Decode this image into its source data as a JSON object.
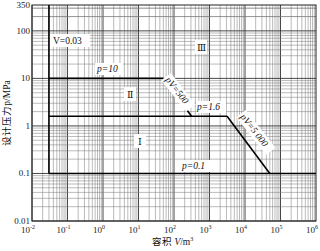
{
  "chart_data": {
    "type": "line",
    "title": "",
    "xlabel": "容积 V/m³",
    "ylabel": "设计压力p/MPa",
    "x_scale": "log",
    "y_scale": "log",
    "xlim": [
      0.01,
      1000000
    ],
    "ylim": [
      0.01,
      350
    ],
    "grid": true,
    "x_ticks": [
      "10⁻²",
      "10⁻¹",
      "10⁰",
      "10¹",
      "10²",
      "10³",
      "10⁴",
      "10⁵",
      "10⁶"
    ],
    "x_tick_values": [
      0.01,
      0.1,
      1,
      10,
      100,
      1000,
      10000,
      100000,
      1000000
    ],
    "y_ticks": [
      "350",
      "100",
      "10",
      "1",
      "0.1",
      "0.01"
    ],
    "y_tick_values": [
      350,
      100,
      10,
      1,
      0.1,
      0.01
    ],
    "series": [
      {
        "name": "V=0.03",
        "points": [
          [
            0.03,
            0.1
          ],
          [
            0.03,
            350
          ]
        ]
      },
      {
        "name": "p=10",
        "points": [
          [
            0.03,
            10
          ],
          [
            50,
            10
          ]
        ]
      },
      {
        "name": "pV=500",
        "points": [
          [
            50,
            10
          ],
          [
            312.5,
            1.6
          ]
        ]
      },
      {
        "name": "p=1.6",
        "points": [
          [
            0.03,
            1.6
          ],
          [
            3125,
            1.6
          ]
        ]
      },
      {
        "name": "pV=5000",
        "points": [
          [
            3125,
            1.6
          ],
          [
            50000,
            0.1
          ]
        ]
      },
      {
        "name": "p=0.1",
        "points": [
          [
            0.03,
            0.1
          ],
          [
            1000000,
            0.1
          ]
        ]
      }
    ],
    "annotations": [
      {
        "text": "V=0.03",
        "x": 0.12,
        "y": 45
      },
      {
        "text": "p=10",
        "x": 3,
        "y": 16
      },
      {
        "text": "pV=500",
        "x": 140,
        "y": 3.5,
        "rotated": true
      },
      {
        "text": "p=1.6",
        "x": 600,
        "y": 2.0
      },
      {
        "text": "pV=5 000",
        "x": 15000,
        "y": 0.4,
        "rotated": true
      },
      {
        "text": "p=0.1",
        "x": 1000,
        "y": 0.13
      },
      {
        "text": "Ⅲ",
        "x": 300,
        "y": 40
      },
      {
        "text": "Ⅱ",
        "x": 10,
        "y": 4
      },
      {
        "text": "Ⅰ",
        "x": 30,
        "y": 0.6
      }
    ]
  },
  "labels": {
    "y_axis": "设计压力p/MPa",
    "x_axis_prefix": "容积 ",
    "x_axis_var": "V",
    "x_axis_unit": "/m",
    "x_axis_exp": "3",
    "v003": "V=0.03",
    "p10": "p=10",
    "pv500": "pV=500",
    "p16": "p=1.6",
    "pv5000": "pV=5 000",
    "p01": "p=0.1",
    "region3": "Ⅲ",
    "region2": "Ⅱ",
    "region1": "Ⅰ"
  },
  "y_ticks": [
    "350",
    "100",
    "10",
    "1",
    "0.1",
    "0.01"
  ],
  "x_ticks_exp": [
    "-2",
    "-1",
    "0",
    "1",
    "2",
    "3",
    "4",
    "5",
    "6"
  ]
}
